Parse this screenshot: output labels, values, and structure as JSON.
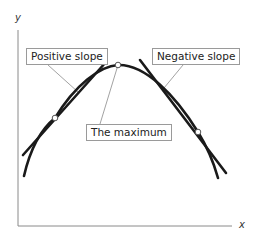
{
  "diagram": {
    "axes": {
      "x_label": "x",
      "y_label": "y"
    },
    "labels": {
      "positive_slope": "Positive slope",
      "negative_slope": "Negative slope",
      "maximum": "The maximum"
    },
    "colors": {
      "curve": "#1a1a1a",
      "axis": "#8a8a8a",
      "leader": "#8a8a8a",
      "box_border": "#9a9a9a"
    }
  }
}
